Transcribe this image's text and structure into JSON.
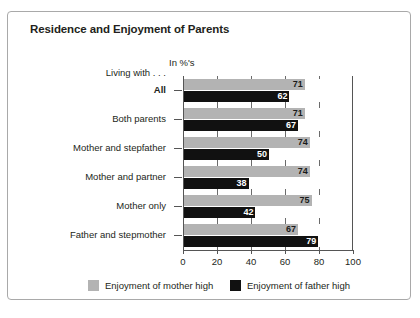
{
  "title": "Residence and Enjoyment of Parents",
  "units_label": "In %'s",
  "axis_caption": "Living with . . .",
  "legend": [
    {
      "key": "mother",
      "label": "Enjoyment of mother high",
      "color": "#b3b3b3"
    },
    {
      "key": "father",
      "label": "Enjoyment of father high",
      "color": "#111111"
    }
  ],
  "xticks": [
    "0",
    "20",
    "40",
    "60",
    "80",
    "100"
  ],
  "chart_data": {
    "type": "bar",
    "orientation": "horizontal",
    "title": "Residence and Enjoyment of Parents",
    "subtitle": "In %'s",
    "xlabel": "In %'s",
    "ylabel": "Living with . . .",
    "xlim": [
      0,
      100
    ],
    "xticks": [
      0,
      20,
      40,
      60,
      80,
      100
    ],
    "grid": true,
    "legend_position": "bottom",
    "categories": [
      "All",
      "Both parents",
      "Mother and stepfather",
      "Mother and partner",
      "Mother only",
      "Father and stepmother"
    ],
    "series": [
      {
        "name": "Enjoyment of mother high",
        "color": "#b3b3b3",
        "values": [
          71,
          71,
          74,
          74,
          75,
          67
        ]
      },
      {
        "name": "Enjoyment of father high",
        "color": "#111111",
        "values": [
          62,
          67,
          50,
          38,
          42,
          79
        ]
      }
    ]
  }
}
